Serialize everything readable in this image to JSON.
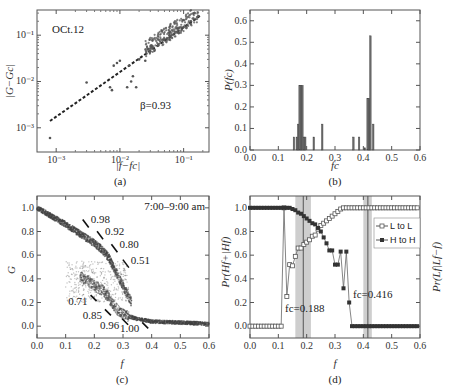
{
  "figure": {
    "panels": [
      {
        "id": "a",
        "label": "(a)"
      },
      {
        "id": "b",
        "label": "(b)"
      },
      {
        "id": "c",
        "label": "(c)"
      },
      {
        "id": "d",
        "label": "(d)"
      }
    ]
  },
  "chart_data": [
    {
      "panel": "(a)",
      "type": "scatter",
      "title": "",
      "annotation_date": "OCt.12",
      "annotation_beta": "β=0.93",
      "xlabel": "|f−fc|",
      "ylabel": "|G−Gc|",
      "xscale": "log",
      "yscale": "log",
      "xlim": [
        0.0005,
        0.25
      ],
      "ylim": [
        0.0003,
        0.35
      ],
      "xticks": [
        "10⁻³",
        "10⁻²",
        "10⁻¹"
      ],
      "yticks": [
        "10⁻³",
        "10⁻²",
        "10⁻¹"
      ],
      "fit_line": {
        "style": "dashed",
        "x": [
          0.0008,
          0.18
        ],
        "y": [
          0.0014,
          0.26
        ]
      },
      "points": [
        {
          "x": 0.0008,
          "y": 0.0006
        },
        {
          "x": 0.003,
          "y": 0.0095
        },
        {
          "x": 0.007,
          "y": 0.0075
        },
        {
          "x": 0.0075,
          "y": 0.0065
        },
        {
          "x": 0.008,
          "y": 0.022
        },
        {
          "x": 0.009,
          "y": 0.025
        },
        {
          "x": 0.01,
          "y": 0.028
        },
        {
          "x": 0.013,
          "y": 0.0075
        },
        {
          "x": 0.014,
          "y": 0.022
        },
        {
          "x": 0.015,
          "y": 0.01
        },
        {
          "x": 0.016,
          "y": 0.013
        },
        {
          "x": 0.018,
          "y": 0.0075
        },
        {
          "x": 0.02,
          "y": 0.03
        },
        {
          "x": 0.025,
          "y": 0.028
        },
        {
          "x": 0.03,
          "y": 0.045
        },
        {
          "x": 0.04,
          "y": 0.06
        },
        {
          "x": 0.05,
          "y": 0.08
        },
        {
          "x": 0.06,
          "y": 0.1
        },
        {
          "x": 0.08,
          "y": 0.12
        },
        {
          "x": 0.1,
          "y": 0.15
        },
        {
          "x": 0.13,
          "y": 0.2
        },
        {
          "x": 0.17,
          "y": 0.26
        }
      ]
    },
    {
      "panel": "(b)",
      "type": "bar",
      "title": "",
      "xlabel": "fc",
      "ylabel": "P(fc)",
      "xlim": [
        0.0,
        0.6
      ],
      "ylim": [
        0.0,
        0.65
      ],
      "xticks": [
        "0.0",
        "0.1",
        "0.2",
        "0.3",
        "0.4",
        "0.5",
        "0.6"
      ],
      "yticks": [
        "0.0",
        "0.1",
        "0.2",
        "0.3",
        "0.4",
        "0.5",
        "0.6"
      ],
      "categories": [
        0.155,
        0.165,
        0.17,
        0.175,
        0.18,
        0.185,
        0.19,
        0.195,
        0.225,
        0.255,
        0.365,
        0.385,
        0.405,
        0.415,
        0.42,
        0.425,
        0.435
      ],
      "values": [
        0.06,
        0.06,
        0.12,
        0.3,
        0.3,
        0.3,
        0.06,
        0.06,
        0.06,
        0.12,
        0.06,
        0.06,
        0.01,
        0.24,
        0.24,
        0.53,
        0.12
      ]
    },
    {
      "panel": "(c)",
      "type": "scatter",
      "title": "",
      "annotation_time": "7:00–9:00 am",
      "xlabel": "f",
      "ylabel": "G",
      "xlim": [
        0.0,
        0.6
      ],
      "ylim": [
        -0.1,
        1.1
      ],
      "xticks": [
        "0.0",
        "0.1",
        "0.2",
        "0.3",
        "0.4",
        "0.5",
        "0.6"
      ],
      "yticks": [
        "0.0",
        "0.2",
        "0.4",
        "0.6",
        "0.8",
        "1.0"
      ],
      "upper_branch": {
        "x": [
          0.0,
          0.05,
          0.1,
          0.15,
          0.2,
          0.23,
          0.25,
          0.27,
          0.3,
          0.33
        ],
        "y": [
          1.0,
          0.93,
          0.86,
          0.78,
          0.7,
          0.64,
          0.58,
          0.48,
          0.34,
          0.2
        ]
      },
      "lower_branch": {
        "x": [
          0.15,
          0.18,
          0.2,
          0.23,
          0.25,
          0.28,
          0.3,
          0.35,
          0.4,
          0.5,
          0.6
        ],
        "y": [
          0.42,
          0.38,
          0.34,
          0.3,
          0.24,
          0.14,
          0.1,
          0.06,
          0.04,
          0.03,
          0.02
        ]
      },
      "arrow_labels": [
        {
          "text": "0.98",
          "x": 0.17,
          "y": 0.86
        },
        {
          "text": "0.92",
          "x": 0.22,
          "y": 0.76
        },
        {
          "text": "0.80",
          "x": 0.27,
          "y": 0.65
        },
        {
          "text": "0.51",
          "x": 0.31,
          "y": 0.52
        },
        {
          "text": "0.71",
          "x": 0.18,
          "y": 0.22
        },
        {
          "text": "0.85",
          "x": 0.23,
          "y": 0.1
        },
        {
          "text": "0.96",
          "x": 0.29,
          "y": 0.02
        },
        {
          "text": "1.00",
          "x": 0.36,
          "y": -0.01
        }
      ]
    },
    {
      "panel": "(d)",
      "type": "line",
      "title": "",
      "xlabel": "f",
      "ylabel_left": "Pr(Hf+|Hf)",
      "ylabel_right": "Pr(Lf|Lf−f)",
      "xlim": [
        0.0,
        0.6
      ],
      "ylim": [
        -0.1,
        1.1
      ],
      "xticks": [
        "0.0",
        "0.1",
        "0.2",
        "0.3",
        "0.4",
        "0.5",
        "0.6"
      ],
      "yticks": [
        "0.0",
        "0.2",
        "0.4",
        "0.6",
        "0.8",
        "1.0"
      ],
      "legend": {
        "position": "upper right",
        "entries": [
          "L to L",
          "H to H"
        ]
      },
      "critical_points": [
        {
          "label": "fc=0.188",
          "x": 0.188,
          "band": [
            0.16,
            0.215
          ]
        },
        {
          "label": "fc=0.416",
          "x": 0.416,
          "band": [
            0.4,
            0.43
          ]
        }
      ],
      "x": [
        0.0,
        0.01,
        0.02,
        0.03,
        0.04,
        0.05,
        0.06,
        0.07,
        0.08,
        0.09,
        0.1,
        0.11,
        0.12,
        0.13,
        0.14,
        0.15,
        0.16,
        0.17,
        0.18,
        0.19,
        0.2,
        0.21,
        0.22,
        0.23,
        0.24,
        0.25,
        0.26,
        0.27,
        0.28,
        0.29,
        0.3,
        0.31,
        0.32,
        0.33,
        0.34,
        0.35,
        0.36,
        0.37,
        0.38,
        0.39,
        0.4,
        0.41,
        0.42,
        0.43,
        0.44,
        0.45,
        0.46,
        0.47,
        0.48,
        0.49,
        0.5,
        0.51,
        0.52,
        0.53,
        0.54,
        0.55,
        0.56,
        0.57,
        0.58,
        0.59
      ],
      "series": [
        {
          "name": "L to L",
          "marker": "open-square",
          "values": [
            0,
            0,
            0,
            0,
            0,
            0,
            0,
            0,
            0,
            0,
            0,
            0,
            1.0,
            0.25,
            0.52,
            0.51,
            0.59,
            0.66,
            0.66,
            0.69,
            0.71,
            0.73,
            0.76,
            0.77,
            0.82,
            0.85,
            0.87,
            0.89,
            0.91,
            0.93,
            0.95,
            0.97,
            0.99,
            1.0,
            1.0,
            1.0,
            1.0,
            1.0,
            1.0,
            1.0,
            1.0,
            1.0,
            1.0,
            1.0,
            1.0,
            1.0,
            1.0,
            1.0,
            1.0,
            1.0,
            1.0,
            1.0,
            1.0,
            1.0,
            1.0,
            1.0,
            1.0,
            1.0,
            1.0,
            1.0
          ]
        },
        {
          "name": "H to H",
          "marker": "filled-square",
          "values": [
            1.0,
            1.0,
            1.0,
            1.0,
            1.0,
            1.0,
            1.0,
            1.0,
            1.0,
            1.0,
            1.0,
            1.0,
            1.0,
            1.0,
            1.0,
            0.99,
            0.98,
            0.96,
            0.95,
            0.93,
            0.91,
            0.89,
            0.87,
            0.86,
            0.83,
            0.8,
            0.75,
            0.7,
            0.64,
            0.64,
            0.52,
            0.52,
            0.63,
            0.32,
            0.63,
            0.2,
            0,
            0,
            0,
            0,
            0,
            0,
            0,
            0,
            0,
            0,
            0,
            0,
            0,
            0,
            0,
            0,
            0,
            0,
            0,
            0,
            0,
            0,
            0,
            0
          ]
        }
      ]
    }
  ]
}
